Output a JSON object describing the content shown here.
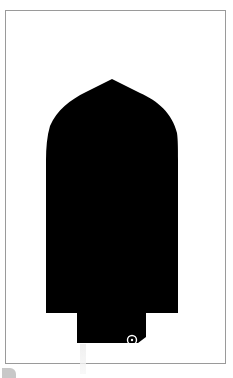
{
  "image": {
    "description": "Black silhouette shape (pointed-arch top, straight sides, stepped narrower base) inside a thin gray frame",
    "colors": {
      "background": "#ffffff",
      "frame_border": "#9a9a9a",
      "silhouette_fill": "#000000",
      "marker_ring": "#ffffff"
    },
    "silhouette": {
      "apex": [
        112,
        79
      ],
      "left_edge_x": 46,
      "right_edge_x": 178,
      "shoulder_y": 313,
      "base_left_x": 77,
      "base_right_x": 146,
      "base_bottom_y": 343
    },
    "marker": {
      "icon": "circle-marker-icon",
      "center": [
        132,
        340
      ]
    }
  }
}
